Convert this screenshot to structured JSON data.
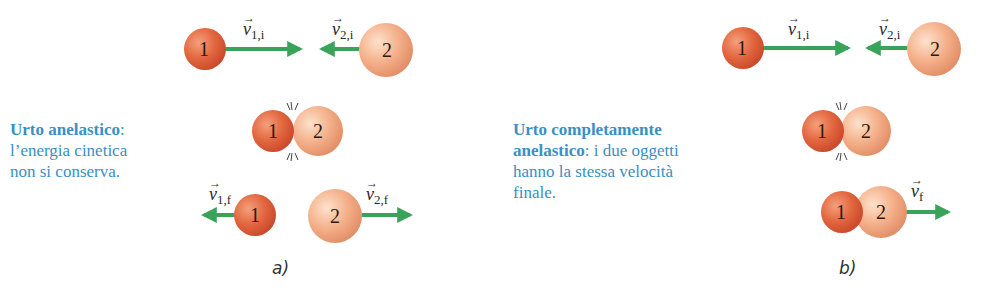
{
  "panel_a": {
    "label": "a)",
    "caption_title": "Urto anelastico",
    "caption_colon": ":",
    "caption_line2": "l’energia cinetica",
    "caption_line3": "non si conserva.",
    "before": {
      "ball1": "1",
      "ball2": "2",
      "v1_sym": "v",
      "v1_sub": "1,i",
      "v2_sym": "v",
      "v2_sub": "2,i"
    },
    "collision": {
      "ball1": "1",
      "ball2": "2"
    },
    "after": {
      "ball1": "1",
      "ball2": "2",
      "v1_sym": "v",
      "v1_sub": "1,f",
      "v2_sym": "v",
      "v2_sub": "2,f"
    }
  },
  "panel_b": {
    "label": "b)",
    "caption_title_line1": "Urto completamente",
    "caption_title_line2": "anelastico",
    "caption_rest_line2": ": i due oggetti",
    "caption_line3": "hanno la stessa velocità",
    "caption_line4": "finale.",
    "before": {
      "ball1": "1",
      "ball2": "2",
      "v1_sym": "v",
      "v1_sub": "1,i",
      "v2_sym": "v",
      "v2_sub": "2,i"
    },
    "collision": {
      "ball1": "1",
      "ball2": "2"
    },
    "after": {
      "ball1": "1",
      "ball2": "2",
      "vf_sym": "v",
      "vf_sub": "f"
    }
  },
  "colors": {
    "caption": "#3a8fc4",
    "ball1": "#e2673f",
    "ball2": "#f4b08a",
    "arrow": "#3aa35a"
  }
}
